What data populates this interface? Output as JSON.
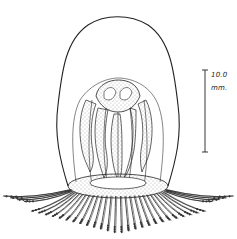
{
  "figure": {
    "scale_bar": {
      "value_label": "10.0",
      "unit_label": "mm."
    },
    "colors": {
      "ink": "#222222",
      "background": "#ffffff",
      "stipple": "#555555"
    }
  }
}
